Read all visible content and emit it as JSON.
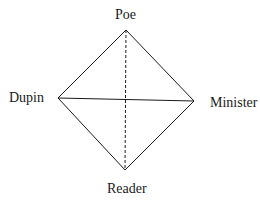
{
  "diagram": {
    "type": "diamond-relationship",
    "nodes": {
      "top": {
        "label": "Poe",
        "x": 126,
        "y": 30
      },
      "left": {
        "label": "Dupin",
        "x": 58,
        "y": 98
      },
      "right": {
        "label": "Minister",
        "x": 194,
        "y": 101
      },
      "bottom": {
        "label": "Reader",
        "x": 125,
        "y": 170
      }
    },
    "edges": [
      {
        "from": "Poe",
        "to": "Dupin",
        "style": "solid"
      },
      {
        "from": "Poe",
        "to": "Minister",
        "style": "solid"
      },
      {
        "from": "Dupin",
        "to": "Reader",
        "style": "solid"
      },
      {
        "from": "Minister",
        "to": "Reader",
        "style": "solid"
      },
      {
        "from": "Dupin",
        "to": "Minister",
        "style": "solid"
      },
      {
        "from": "Poe",
        "to": "Reader",
        "style": "dashed"
      }
    ],
    "colors": {
      "line": "#1a1a1a",
      "background": "#ffffff"
    }
  }
}
